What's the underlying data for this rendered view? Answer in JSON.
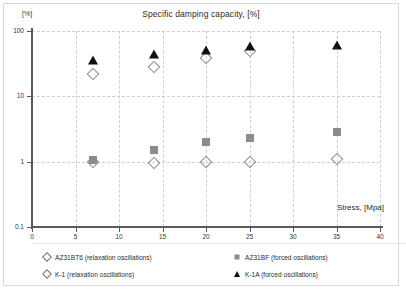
{
  "chart_data": {
    "type": "scatter",
    "title": "Specific damping capacity, [%]",
    "xlabel": "Stress, [Mpa]",
    "ylabel": "[%]",
    "y_unit_label": "[%]",
    "yscale": "log",
    "xlim": [
      0,
      40
    ],
    "ylim": [
      0.1,
      100
    ],
    "grid": true,
    "x_ticks": [
      0,
      5,
      10,
      15,
      20,
      25,
      30,
      35,
      40
    ],
    "x_tick_labels": [
      "0",
      "5",
      "10",
      "15",
      "20",
      "25",
      "30",
      "35",
      "40"
    ],
    "y_ticks": [
      0.1,
      1,
      10,
      100
    ],
    "y_tick_labels": [
      "0.1",
      "1",
      "10",
      "100"
    ],
    "legend_position": "bottom",
    "series": [
      {
        "name": "AZ31BT6 (relaxation oscillations)",
        "marker": "open-diamond",
        "color": "#8a8a8a",
        "points": [
          {
            "x": 7,
            "y": 1.0
          }
        ]
      },
      {
        "name": "AZ31BF (forced oscillations)",
        "marker": "filled-square",
        "color": "#8c8c8c",
        "points": [
          {
            "x": 7,
            "y": 1.05
          },
          {
            "x": 14,
            "y": 1.5
          },
          {
            "x": 20,
            "y": 2.0
          },
          {
            "x": 25,
            "y": 2.3
          },
          {
            "x": 35,
            "y": 2.8
          }
        ]
      },
      {
        "name": "K-1 (relaxation oscillations)",
        "marker": "open-diamond",
        "color": "#8a8a8a",
        "points": [
          {
            "x": 7,
            "y": 22
          },
          {
            "x": 14,
            "y": 28
          },
          {
            "x": 20,
            "y": 38
          },
          {
            "x": 25,
            "y": 50
          },
          {
            "x": 14,
            "y": 0.97
          },
          {
            "x": 20,
            "y": 0.98
          },
          {
            "x": 25,
            "y": 1.0
          },
          {
            "x": 35,
            "y": 1.1
          }
        ]
      },
      {
        "name": "K-1A (forced oscillations)",
        "marker": "filled-triangle",
        "color": "#111111",
        "points": [
          {
            "x": 7,
            "y": 36
          },
          {
            "x": 14,
            "y": 45
          },
          {
            "x": 20,
            "y": 52
          },
          {
            "x": 25,
            "y": 58
          },
          {
            "x": 35,
            "y": 62
          }
        ]
      }
    ]
  },
  "legend": {
    "items": [
      {
        "label": "AZ31BT6 (relaxation oscillations)",
        "marker": "open-diamond"
      },
      {
        "label": "AZ31BF (forced oscillations)",
        "marker": "filled-square"
      },
      {
        "label": "K-1 (relaxation oscillations)",
        "marker": "open-diamond"
      },
      {
        "label": "K-1A (forced oscillations)",
        "marker": "filled-triangle"
      }
    ]
  }
}
